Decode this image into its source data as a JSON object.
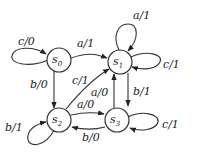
{
  "diagram": {
    "type": "finite-state-machine",
    "states": [
      {
        "id": "s0",
        "name": "s",
        "sub": "0"
      },
      {
        "id": "s1",
        "name": "s",
        "sub": "1"
      },
      {
        "id": "s2",
        "name": "s",
        "sub": "2"
      },
      {
        "id": "s3",
        "name": "s",
        "sub": "3"
      }
    ],
    "transitions": [
      {
        "from": "s0",
        "to": "s0",
        "label": "c/0"
      },
      {
        "from": "s0",
        "to": "s1",
        "label": "a/1"
      },
      {
        "from": "s0",
        "to": "s2",
        "label": "b/0"
      },
      {
        "from": "s1",
        "to": "s1",
        "label": "a/1"
      },
      {
        "from": "s1",
        "to": "s1",
        "label": "c/1"
      },
      {
        "from": "s1",
        "to": "s3",
        "label": "b/1"
      },
      {
        "from": "s2",
        "to": "s2",
        "label": "b/1"
      },
      {
        "from": "s2",
        "to": "s1",
        "label": "c/1"
      },
      {
        "from": "s2",
        "to": "s3",
        "label": "a/0"
      },
      {
        "from": "s3",
        "to": "s3",
        "label": "c/1"
      },
      {
        "from": "s3",
        "to": "s1",
        "label": "a/0"
      },
      {
        "from": "s3",
        "to": "s2",
        "label": "b/0"
      }
    ]
  }
}
